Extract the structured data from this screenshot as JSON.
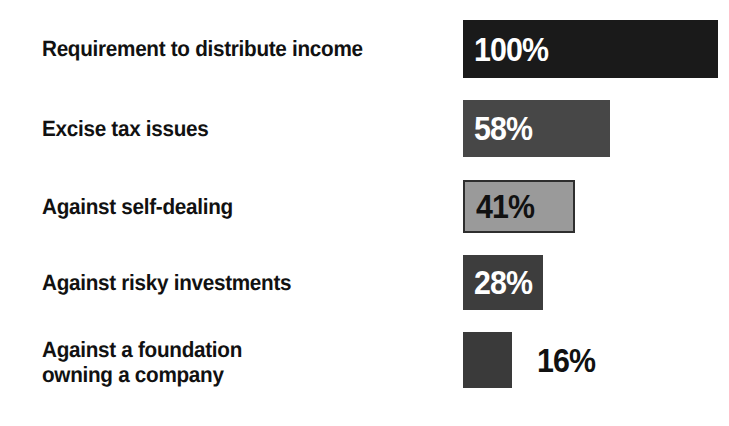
{
  "chart_data": {
    "type": "bar",
    "orientation": "horizontal",
    "title": "",
    "subtitle": "",
    "xlabel": "",
    "ylabel": "",
    "xlim": [
      0,
      100
    ],
    "grid": false,
    "legend": "none",
    "value_suffix": "%",
    "categories": [
      "Requirement to distribute income",
      "Excise tax issues",
      "Against self-dealing",
      "Against risky investments",
      "Against a foundation\nowning a company"
    ],
    "values": [
      100,
      58,
      41,
      28,
      16
    ],
    "value_labels": [
      "100%",
      "58%",
      "41%",
      "28%",
      "16%"
    ],
    "bar_colors": [
      "#1a1a1a",
      "#474747",
      "#9a9a9a",
      "#3d3d3d",
      "#3a3a3a"
    ],
    "value_text_colors": [
      "#ffffff",
      "#ffffff",
      "#111111",
      "#ffffff",
      "#111111"
    ],
    "value_label_placement": [
      "inside",
      "inside",
      "inside",
      "inside",
      "outside"
    ],
    "category_text_color": "#111111",
    "background_color": "#ffffff"
  },
  "rows": [
    {
      "category": "Requirement to distribute income",
      "value": 100,
      "value_label": "100%",
      "color": "#1a1a1a"
    },
    {
      "category": "Excise tax issues",
      "value": 58,
      "value_label": "58%",
      "color": "#474747"
    },
    {
      "category": "Against self-dealing",
      "value": 41,
      "value_label": "41%",
      "color": "#9a9a9a"
    },
    {
      "category": "Against risky investments",
      "value": 28,
      "value_label": "28%",
      "color": "#3d3d3d"
    },
    {
      "category": "Against a foundation\nowning a company",
      "value": 16,
      "value_label": "16%",
      "color": "#3a3a3a"
    }
  ]
}
